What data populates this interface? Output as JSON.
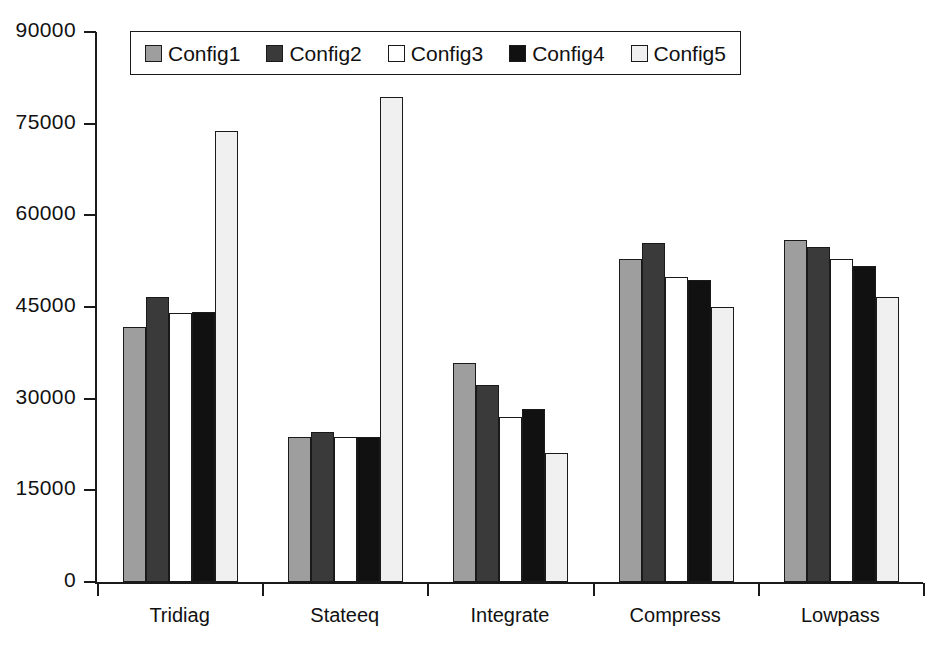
{
  "chart_data": {
    "type": "bar",
    "title": "",
    "xlabel": "",
    "ylabel": "",
    "ylim": [
      0,
      90000
    ],
    "yticks": [
      0,
      15000,
      30000,
      45000,
      60000,
      75000,
      90000
    ],
    "ytick_labels": [
      "0",
      "15000",
      "30000",
      "45000",
      "60000",
      "75000",
      "90000"
    ],
    "grid": false,
    "legend_position": "top-center",
    "categories": [
      "Tridiag",
      "Stateeq",
      "Integrate",
      "Compress",
      "Lowpass"
    ],
    "series": [
      {
        "name": "Config1",
        "color": "#9e9e9e",
        "values": [
          41800,
          23700,
          35800,
          52800,
          56000
        ]
      },
      {
        "name": "Config2",
        "color": "#3a3a3a",
        "values": [
          46700,
          24500,
          32200,
          55500,
          54800
        ]
      },
      {
        "name": "Config3",
        "color": "#ffffff",
        "values": [
          44000,
          23700,
          27000,
          49900,
          52800
        ]
      },
      {
        "name": "Config4",
        "color": "#111111",
        "values": [
          44200,
          23700,
          28300,
          49400,
          51700
        ]
      },
      {
        "name": "Config5",
        "color": "#f0f0f0",
        "values": [
          73800,
          79400,
          21100,
          45000,
          46600
        ]
      }
    ]
  },
  "legend": {
    "items": [
      {
        "label": "Config1"
      },
      {
        "label": "Config2"
      },
      {
        "label": "Config3"
      },
      {
        "label": "Config4"
      },
      {
        "label": "Config5"
      }
    ]
  },
  "axes": {
    "y_tick_labels": [
      "90000",
      "75000",
      "60000",
      "45000",
      "30000",
      "15000",
      "0"
    ],
    "x_tick_labels": [
      "Tridiag",
      "Stateeq",
      "Integrate",
      "Compress",
      "Lowpass"
    ]
  }
}
